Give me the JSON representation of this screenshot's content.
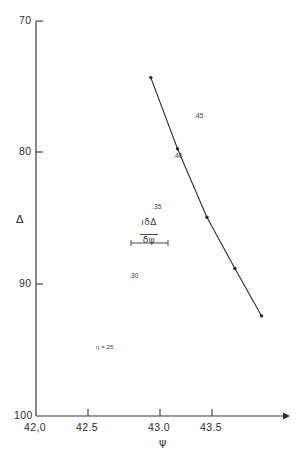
{
  "chart_data": {
    "type": "line",
    "title": "",
    "subtitle": "",
    "xlabel": "ψ",
    "ylabel": "Δ",
    "xlim": [
      42.0,
      43.85
    ],
    "ylim": [
      100,
      70
    ],
    "y_axis_inverted": true,
    "grid": false,
    "legend": "none",
    "xticks": [
      42.0,
      42.5,
      43.0,
      43.5
    ],
    "xtick_labels": [
      "42,0",
      "42.5",
      "43.0",
      "43.5"
    ],
    "yticks": [
      70,
      80,
      90,
      100
    ],
    "ytick_labels": [
      "70",
      "80",
      "90",
      "100"
    ],
    "series": [
      {
        "name": "η",
        "marker": "dot",
        "point_labels": [
          "η =.25",
          ".30",
          ".35",
          ".40",
          ".45"
        ],
        "x": [
          42.86,
          43.06,
          43.28,
          43.49,
          43.69
        ],
        "y": [
          95.7,
          90.3,
          85.1,
          81.2,
          77.6
        ]
      }
    ],
    "annotations": [
      {
        "name": "slope-scale-bar",
        "numerator": "δΔ",
        "numerator_prefix": "ı",
        "denominator": "δψ",
        "bar": true
      }
    ]
  },
  "axes": {
    "y_title": "Δ",
    "x_title": "ψ"
  }
}
